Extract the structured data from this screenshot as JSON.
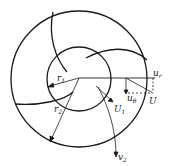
{
  "diagram": {
    "type": "impeller-velocity-diagram",
    "labels": {
      "r1": "r",
      "r1_sub": "1",
      "r2": "r",
      "r2_sub": "2",
      "ur": "u",
      "ur_sub": "r",
      "utheta": "u",
      "utheta_sub": "θ",
      "U": "U",
      "U1": "U",
      "U1_sub": "1",
      "v2": "v",
      "v2_sub": "2"
    },
    "colors": {
      "stroke": "#1a1a1a",
      "background": "#ffffff"
    }
  }
}
